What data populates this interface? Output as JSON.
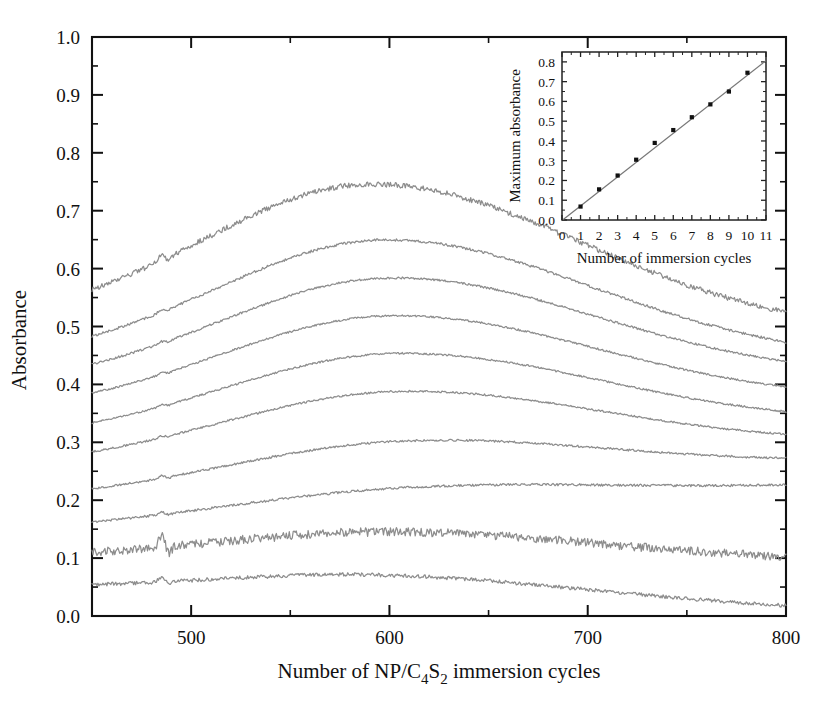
{
  "chart_data": {
    "type": "line",
    "title": "",
    "xlabel": "Number of NP/C4S2 immersion cycles",
    "xlabel_parts": [
      {
        "t": "Number of NP/C",
        "sub": false
      },
      {
        "t": "4",
        "sub": true
      },
      {
        "t": "S",
        "sub": false
      },
      {
        "t": "2",
        "sub": true
      },
      {
        "t": " immersion cycles",
        "sub": false
      }
    ],
    "ylabel": "Absorbance",
    "xlim": [
      450,
      800
    ],
    "ylim": [
      0.0,
      1.0
    ],
    "x_major_ticks": [
      500,
      600,
      700,
      800
    ],
    "x_major_tick_labels": [
      "500",
      "600",
      "700",
      "800"
    ],
    "x_minor_ticks": [
      450,
      550,
      650,
      750
    ],
    "y_major_ticks": [
      0.0,
      0.1,
      0.2,
      0.3,
      0.4,
      0.5,
      0.6,
      0.7,
      0.8,
      0.9,
      1.0
    ],
    "y_major_tick_labels": [
      "0.0",
      "0.1",
      "0.2",
      "0.3",
      "0.4",
      "0.5",
      "0.6",
      "0.7",
      "0.8",
      "0.9",
      "1.0"
    ],
    "y_minor_ticks": [
      0.05,
      0.15,
      0.25,
      0.35,
      0.45,
      0.55,
      0.65,
      0.75,
      0.85,
      0.95
    ],
    "grid": false,
    "legend": "none",
    "line_color": "#8d8d8d",
    "axis_color": "#111111",
    "series": [
      {
        "name": "10 cycles",
        "cycles": 10,
        "start": 0.5,
        "peak": 0.745,
        "peak_x": 592,
        "end": 0.49,
        "noise": 0.0045,
        "spike_x": 485,
        "spike": 0.012
      },
      {
        "name": "9 cycles",
        "cycles": 9,
        "start": 0.435,
        "peak": 0.65,
        "peak_x": 598,
        "end": 0.44,
        "noise": 0.0022,
        "spike_x": 485,
        "spike": 0.004
      },
      {
        "name": "8 cycles",
        "cycles": 8,
        "start": 0.395,
        "peak": 0.585,
        "peak_x": 600,
        "end": 0.41,
        "noise": 0.0018,
        "spike_x": 485,
        "spike": 0.003
      },
      {
        "name": "7 cycles",
        "cycles": 7,
        "start": 0.35,
        "peak": 0.52,
        "peak_x": 600,
        "end": 0.37,
        "noise": 0.0016,
        "spike_x": 485,
        "spike": 0.003
      },
      {
        "name": "6 cycles",
        "cycles": 6,
        "start": 0.305,
        "peak": 0.455,
        "peak_x": 602,
        "end": 0.33,
        "noise": 0.0016,
        "spike_x": 485,
        "spike": 0.003
      },
      {
        "name": "5 cycles",
        "cycles": 5,
        "start": 0.26,
        "peak": 0.39,
        "peak_x": 602,
        "end": 0.295,
        "noise": 0.0016,
        "spike_x": 485,
        "spike": 0.003
      },
      {
        "name": "4 cycles",
        "cycles": 4,
        "start": 0.205,
        "peak": 0.305,
        "peak_x": 604,
        "end": 0.26,
        "noise": 0.0018,
        "spike_x": 485,
        "spike": 0.004
      },
      {
        "name": "3 cycles",
        "cycles": 3,
        "start": 0.155,
        "peak": 0.225,
        "peak_x": 606,
        "end": 0.22,
        "noise": 0.002,
        "spike_x": 485,
        "spike": 0.004
      },
      {
        "name": "2 cycles",
        "cycles": 2,
        "start": 0.1,
        "peak": 0.145,
        "peak_x": 600,
        "end": 0.095,
        "noise": 0.0075,
        "spike_x": 485,
        "spike": 0.022
      },
      {
        "name": "1 cycle",
        "cycles": 1,
        "start": 0.045,
        "peak": 0.068,
        "peak_x": 596,
        "end": 0.012,
        "noise": 0.0032,
        "spike_x": 485,
        "spike": 0.009
      }
    ]
  },
  "inset_data": {
    "type": "scatter",
    "xlabel": "Number of immersion cycles",
    "ylabel": "Maximum absorbance",
    "xlim": [
      0,
      11
    ],
    "ylim": [
      0.0,
      0.85
    ],
    "x_ticks": [
      0,
      1,
      2,
      3,
      4,
      5,
      6,
      7,
      8,
      9,
      10,
      11
    ],
    "x_tick_labels": [
      "0",
      "1",
      "2",
      "3",
      "4",
      "5",
      "6",
      "7",
      "8",
      "9",
      "10",
      "11"
    ],
    "y_ticks": [
      0.0,
      0.1,
      0.2,
      0.3,
      0.4,
      0.5,
      0.6,
      0.7,
      0.8
    ],
    "y_tick_labels": [
      "0.0",
      "0.1",
      "0.2",
      "0.3",
      "0.4",
      "0.5",
      "0.6",
      "0.7",
      "0.8"
    ],
    "x": [
      1,
      2,
      3,
      4,
      5,
      6,
      7,
      8,
      9,
      10
    ],
    "y": [
      0.068,
      0.155,
      0.225,
      0.305,
      0.39,
      0.455,
      0.52,
      0.585,
      0.65,
      0.745
    ],
    "fit": {
      "slope": 0.0735,
      "intercept": -0.002,
      "x_from": 0.05,
      "x_to": 11.0
    },
    "marker": "square",
    "marker_color": "#111111",
    "fit_color": "#777777"
  }
}
